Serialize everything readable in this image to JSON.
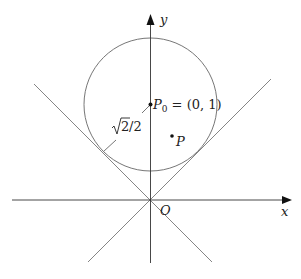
{
  "diagram": {
    "type": "geometry-figure",
    "colors": {
      "axis": "#111111",
      "line": "#777777",
      "circle": "#666666",
      "text": "#222222"
    },
    "axes": {
      "x_label": "x",
      "y_label": "y",
      "origin_label": "O"
    },
    "circle": {
      "center_label": "P",
      "center_subscript": "0",
      "center_coords": " = (0, 1)",
      "radius_label_sqrt": "2",
      "radius_label_rest": "/2"
    },
    "point": {
      "label": "P"
    },
    "lines": [
      {
        "equation": "y = x"
      },
      {
        "equation": "y = -x"
      }
    ]
  }
}
